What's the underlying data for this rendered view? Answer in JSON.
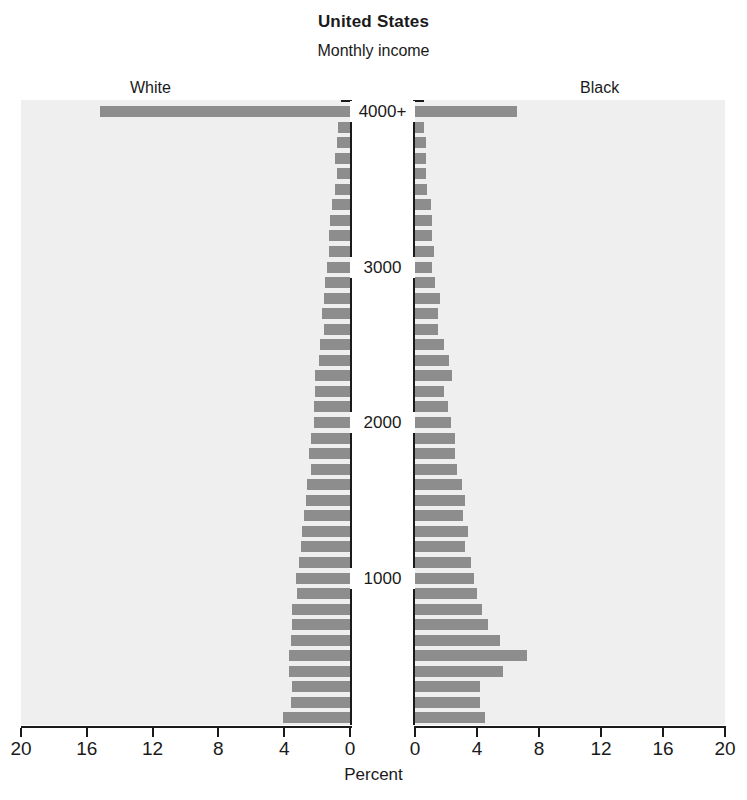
{
  "header": {
    "title": "United States",
    "subtitle": "Monthly income"
  },
  "groups": {
    "left_label": "White",
    "right_label": "Black"
  },
  "axis": {
    "x_label": "Percent",
    "x_ticks_left": [
      "20",
      "16",
      "12",
      "8",
      "4",
      "0"
    ],
    "x_ticks_right": [
      "0",
      "4",
      "8",
      "12",
      "16",
      "20"
    ],
    "income_ticks": [
      "4000+",
      "3000",
      "2000",
      "1000"
    ]
  },
  "colors": {
    "bar": "#8d8d8d",
    "panel_background": "#efefef",
    "axis": "#1a1a1a",
    "page_background": "#ffffff"
  },
  "chart_data": {
    "type": "bar",
    "subtype": "population-pyramid",
    "title": "United States",
    "subtitle": "Monthly income",
    "xlabel": "Percent",
    "ylabel": "Monthly income",
    "xlim": [
      0,
      20
    ],
    "grid": false,
    "legend_position": "top-outside",
    "orientation": "horizontal-diverging",
    "y_tick_labels": [
      "4000+",
      "3000",
      "2000",
      "1000"
    ],
    "y_tick_values": [
      4000,
      3000,
      2000,
      1000
    ],
    "categories": [
      "4000+",
      "3900",
      "3800",
      "3700",
      "3600",
      "3500",
      "3400",
      "3300",
      "3200",
      "3100",
      "3000",
      "2900",
      "2800",
      "2700",
      "2600",
      "2500",
      "2400",
      "2300",
      "2200",
      "2100",
      "2000",
      "1900",
      "1800",
      "1700",
      "1600",
      "1500",
      "1400",
      "1300",
      "1200",
      "1100",
      "1000",
      "900",
      "800",
      "700",
      "600",
      "500",
      "400",
      "300",
      "200",
      "100"
    ],
    "series": [
      {
        "name": "White",
        "direction": "left",
        "values": [
          15.2,
          0.7,
          0.8,
          0.9,
          0.8,
          0.9,
          1.1,
          1.2,
          1.3,
          1.3,
          1.4,
          1.5,
          1.6,
          1.7,
          1.6,
          1.8,
          1.9,
          2.1,
          2.1,
          2.2,
          2.2,
          2.4,
          2.5,
          2.4,
          2.6,
          2.7,
          2.8,
          2.9,
          3.0,
          3.1,
          3.3,
          3.2,
          3.5,
          3.5,
          3.6,
          3.7,
          3.7,
          3.5,
          3.6,
          4.1
        ]
      },
      {
        "name": "Black",
        "direction": "right",
        "values": [
          6.6,
          0.6,
          0.7,
          0.7,
          0.7,
          0.8,
          1.0,
          1.1,
          1.1,
          1.2,
          1.1,
          1.3,
          1.6,
          1.5,
          1.5,
          1.9,
          2.2,
          2.4,
          1.9,
          2.1,
          2.3,
          2.6,
          2.6,
          2.7,
          3.0,
          3.2,
          3.1,
          3.4,
          3.2,
          3.6,
          3.8,
          4.0,
          4.3,
          4.7,
          5.5,
          7.2,
          5.7,
          4.2,
          4.2,
          4.5
        ]
      }
    ]
  }
}
